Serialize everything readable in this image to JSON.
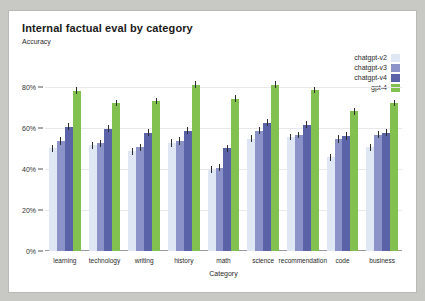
{
  "chart_data": {
    "type": "bar",
    "title": "Internal factual eval by category",
    "subtitle": "Accuracy",
    "xlabel": "Category",
    "ylabel": "Accuracy",
    "ylim": [
      0,
      0.9
    ],
    "grid": true,
    "legend_position": "top-right",
    "ytick_labels": [
      "0%",
      "20%",
      "40%",
      "60%",
      "80%"
    ],
    "ytick_values": [
      0,
      0.2,
      0.4,
      0.6,
      0.8
    ],
    "categories": [
      "learning",
      "technology",
      "writing",
      "history",
      "math",
      "science",
      "recommendation",
      "code",
      "business"
    ],
    "series": [
      {
        "name": "chatgpt-v2",
        "color": "#dfe7f5",
        "values": [
          0.5,
          0.515,
          0.485,
          0.525,
          0.395,
          0.545,
          0.555,
          0.455,
          0.505
        ],
        "errors": [
          0.018,
          0.017,
          0.017,
          0.018,
          0.017,
          0.017,
          0.016,
          0.017,
          0.017
        ]
      },
      {
        "name": "chatgpt-v3",
        "color": "#8b93c9",
        "values": [
          0.535,
          0.525,
          0.505,
          0.535,
          0.405,
          0.585,
          0.565,
          0.545,
          0.565
        ],
        "errors": [
          0.018,
          0.017,
          0.017,
          0.018,
          0.018,
          0.017,
          0.016,
          0.018,
          0.017
        ]
      },
      {
        "name": "chatgpt-v4",
        "color": "#5a62a8",
        "values": [
          0.605,
          0.595,
          0.575,
          0.585,
          0.5,
          0.625,
          0.615,
          0.56,
          0.575
        ],
        "errors": [
          0.017,
          0.017,
          0.017,
          0.018,
          0.018,
          0.016,
          0.016,
          0.018,
          0.017
        ]
      },
      {
        "name": "gpt-4",
        "color": "#82c14f",
        "values": [
          0.78,
          0.72,
          0.73,
          0.81,
          0.74,
          0.81,
          0.785,
          0.68,
          0.72
        ],
        "errors": [
          0.016,
          0.016,
          0.016,
          0.015,
          0.017,
          0.015,
          0.015,
          0.017,
          0.016
        ]
      }
    ]
  }
}
